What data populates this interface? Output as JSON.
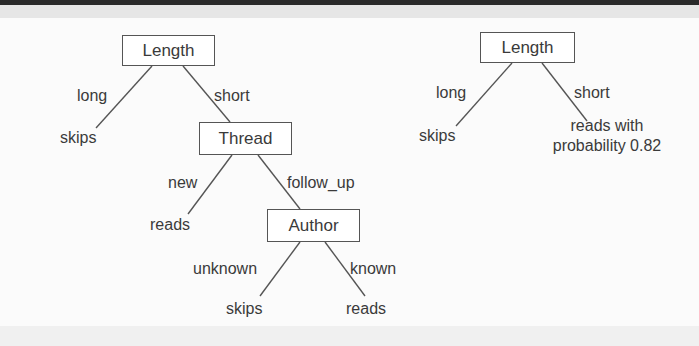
{
  "tree_left": {
    "root": "Length",
    "root_edges": {
      "left": "long",
      "right": "short"
    },
    "leaf_long": "skips",
    "thread_node": "Thread",
    "thread_edges": {
      "left": "new",
      "right": "follow_up"
    },
    "leaf_new": "reads",
    "author_node": "Author",
    "author_edges": {
      "left": "unknown",
      "right": "known"
    },
    "leaf_unknown": "skips",
    "leaf_known": "reads"
  },
  "tree_right": {
    "root": "Length",
    "root_edges": {
      "left": "long",
      "right": "short"
    },
    "leaf_long": "skips",
    "leaf_short_line1": "reads with",
    "leaf_short_line2": "probability 0.82"
  }
}
